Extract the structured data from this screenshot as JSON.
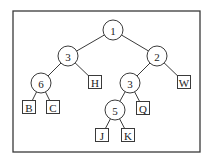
{
  "diagram": {
    "type": "binary-tree",
    "frame": {
      "x": 13,
      "y": 11,
      "width": 187,
      "height": 141
    },
    "nodes": [
      {
        "id": "n1",
        "label": "1",
        "shape": "circle",
        "x": 113,
        "y": 30
      },
      {
        "id": "n3a",
        "label": "3",
        "shape": "circle",
        "x": 68,
        "y": 56
      },
      {
        "id": "n2",
        "label": "2",
        "shape": "circle",
        "x": 157,
        "y": 56
      },
      {
        "id": "n6",
        "label": "6",
        "shape": "circle",
        "x": 41,
        "y": 83
      },
      {
        "id": "lH",
        "label": "H",
        "shape": "square",
        "x": 95,
        "y": 82
      },
      {
        "id": "n3b",
        "label": "3",
        "shape": "circle",
        "x": 130,
        "y": 83
      },
      {
        "id": "lW",
        "label": "W",
        "shape": "square",
        "x": 184,
        "y": 82
      },
      {
        "id": "lB",
        "label": "B",
        "shape": "square",
        "x": 29,
        "y": 107
      },
      {
        "id": "lC",
        "label": "C",
        "shape": "square",
        "x": 53,
        "y": 107
      },
      {
        "id": "n5",
        "label": "5",
        "shape": "circle",
        "x": 115,
        "y": 110
      },
      {
        "id": "lQ",
        "label": "Q",
        "shape": "square",
        "x": 143,
        "y": 108
      },
      {
        "id": "lJ",
        "label": "J",
        "shape": "square",
        "x": 102,
        "y": 135
      },
      {
        "id": "lK",
        "label": "K",
        "shape": "square",
        "x": 128,
        "y": 135
      }
    ],
    "edges": [
      [
        "n1",
        "n3a"
      ],
      [
        "n1",
        "n2"
      ],
      [
        "n3a",
        "n6"
      ],
      [
        "n3a",
        "lH"
      ],
      [
        "n2",
        "n3b"
      ],
      [
        "n2",
        "lW"
      ],
      [
        "n6",
        "lB"
      ],
      [
        "n6",
        "lC"
      ],
      [
        "n3b",
        "n5"
      ],
      [
        "n3b",
        "lQ"
      ],
      [
        "n5",
        "lJ"
      ],
      [
        "n5",
        "lK"
      ]
    ],
    "circle_radius": 10,
    "square_size": 13
  }
}
